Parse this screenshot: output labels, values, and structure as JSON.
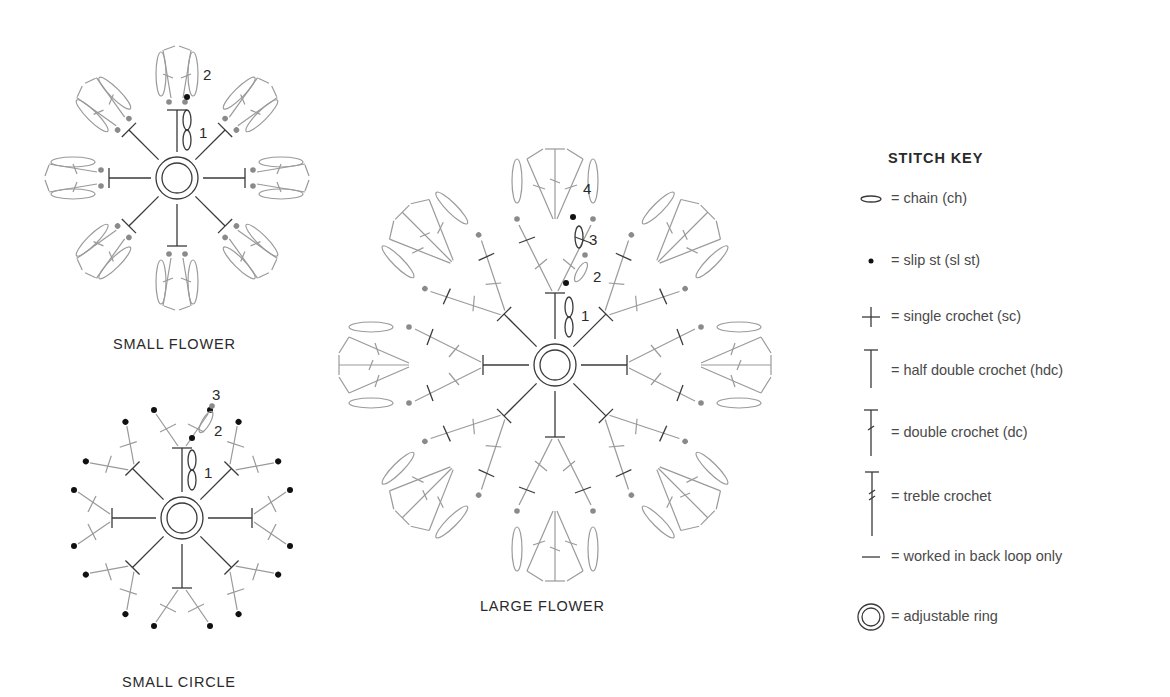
{
  "diagrams": {
    "small_flower": {
      "caption": "SMALL FLOWER",
      "round_labels": [
        "1",
        "2"
      ],
      "petals": 8
    },
    "small_circle": {
      "caption": "SMALL CIRCLE",
      "round_labels": [
        "1",
        "2",
        "3"
      ],
      "spokes": 8
    },
    "large_flower": {
      "caption": "LARGE FLOWER",
      "round_labels": [
        "1",
        "2",
        "3",
        "4"
      ],
      "petals": 8
    }
  },
  "stitch_key": {
    "title": "STITCH KEY",
    "items": [
      {
        "symbol": "chain-icon",
        "label": "= chain (ch)"
      },
      {
        "symbol": "slip-stitch-icon",
        "label": "= slip st (sl st)"
      },
      {
        "symbol": "single-crochet-icon",
        "label": "= single crochet (sc)"
      },
      {
        "symbol": "half-double-crochet-icon",
        "label": "= half double crochet (hdc)"
      },
      {
        "symbol": "double-crochet-icon",
        "label": "= double crochet (dc)"
      },
      {
        "symbol": "treble-crochet-icon",
        "label": "= treble crochet"
      },
      {
        "symbol": "back-loop-icon",
        "label": "= worked in back loop only"
      },
      {
        "symbol": "adjustable-ring-icon",
        "label": "= adjustable ring"
      }
    ]
  },
  "colors": {
    "background": "#ffffff",
    "text": "#2a2a2a",
    "current_round": "#2a2a2a",
    "previous_round": "#9a9a9a"
  }
}
